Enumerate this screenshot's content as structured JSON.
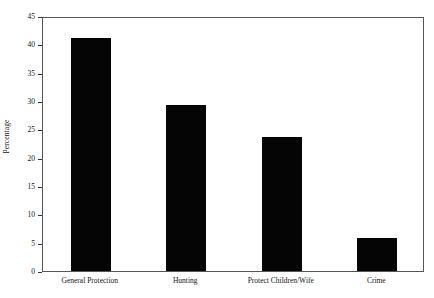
{
  "chart_data": {
    "type": "bar",
    "title": "",
    "subtitle": "",
    "xlabel": "",
    "ylabel": "Percentage",
    "ylim": [
      0,
      45
    ],
    "yticks": [
      0,
      5,
      10,
      15,
      20,
      25,
      30,
      35,
      40,
      45
    ],
    "ytick_labels": [
      "0",
      "5",
      "10",
      "15",
      "20",
      "25",
      "30",
      "35",
      "40",
      "45"
    ],
    "grid": false,
    "legend": false,
    "legend_position": "none",
    "bar_color": "#050505",
    "frame_color": "#555555",
    "categories": [
      "General Protection",
      "Hunting",
      "Protect Children/Wife",
      "Crime"
    ],
    "values": [
      41.2,
      29.3,
      23.6,
      5.8
    ],
    "series": [
      {
        "name": "Percentage",
        "values": [
          41.2,
          29.3,
          23.6,
          5.8
        ]
      }
    ]
  }
}
